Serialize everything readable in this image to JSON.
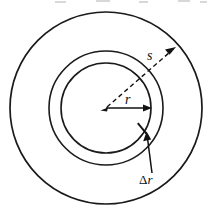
{
  "figure": {
    "kind": "annulus-diagram",
    "background_color": "#ffffff",
    "stroke_color": "#1a1a1a",
    "text_color": "#101010",
    "center": {
      "x": 106,
      "y": 108
    },
    "circles": [
      {
        "name": "inner-circle",
        "radius": 45,
        "stroke_width": 1.6
      },
      {
        "name": "middle-circle",
        "radius": 57,
        "stroke_width": 1.6
      },
      {
        "name": "outer-circle",
        "radius": 96,
        "stroke_width": 1.6
      }
    ],
    "labels": {
      "arc_length": "s",
      "radius": "r",
      "thickness_delta": "Δ",
      "thickness_variable": "r"
    },
    "annotations": [
      {
        "name": "arc-length-leader",
        "label": "s",
        "style": "dashed-arrow",
        "from": {
          "x": 106,
          "y": 108
        },
        "to": {
          "x": 175,
          "y": 48
        }
      },
      {
        "name": "radius-leader",
        "label": "r",
        "style": "solid-arrow",
        "from": {
          "x": 106,
          "y": 108
        },
        "to": {
          "x": 151,
          "y": 108
        }
      },
      {
        "name": "thickness-leader",
        "label": "Δr",
        "style": "solid-arrow",
        "from": {
          "x": 152,
          "y": 173
        },
        "to": {
          "x": 147,
          "y": 132
        }
      },
      {
        "name": "ring-thickness-tick",
        "label": "",
        "style": "radial-segment",
        "from": {
          "x": 138,
          "y": 124
        },
        "to": {
          "x": 146,
          "y": 133
        }
      }
    ]
  }
}
